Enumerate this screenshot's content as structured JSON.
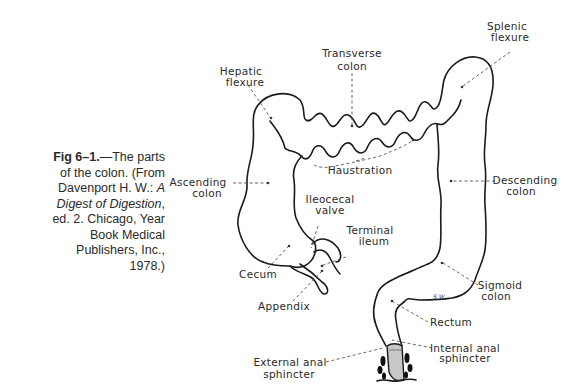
{
  "caption": {
    "fig_label": "Fig 6–1.",
    "text_1": "—The parts of the colon. (From Davenport H. W.: ",
    "book_title": "A Digest of Digestion",
    "text_2": ", ed. 2. Chicago, Year Book Medical Publishers, Inc., 1978.)"
  },
  "labels": {
    "transverse_1": "Transverse",
    "transverse_2": "colon",
    "splenic_1": "Splenic",
    "splenic_2": "flexure",
    "hepatic_1": "Hepatic",
    "hepatic_2": "flexure",
    "haustration": "Haustration",
    "ascending_1": "Ascending",
    "ascending_2": "colon",
    "descending_1": "Descending",
    "descending_2": "colon",
    "ileocecal_1": "Ileocecal",
    "ileocecal_2": "valve",
    "terminal_1": "Terminal",
    "terminal_2": "ileum",
    "cecum": "Cecum",
    "appendix": "Appendix",
    "sigmoid_1": "Sigmoid",
    "sigmoid_2": "colon",
    "rectum": "Rectum",
    "internal_1": "Internal anal",
    "internal_2": "sphincter",
    "external_1": "External anal",
    "external_2": "sphincter",
    "signature": "S.W."
  }
}
